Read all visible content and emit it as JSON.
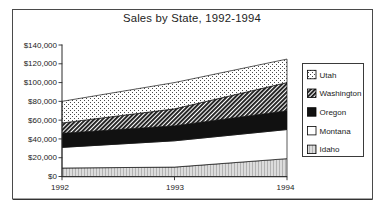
{
  "chart_data": {
    "type": "area",
    "stacked": true,
    "title": "Sales by State, 1992-1994",
    "x": [
      1992,
      1993,
      1994
    ],
    "x_labels": [
      "1992",
      "1993",
      "1994"
    ],
    "series": [
      {
        "name": "Idaho",
        "values": [
          9000,
          10000,
          19000
        ],
        "pattern": "gray-halftone"
      },
      {
        "name": "Montana",
        "values": [
          22000,
          28000,
          31000
        ],
        "pattern": "white"
      },
      {
        "name": "Oregon",
        "values": [
          15000,
          16000,
          20000
        ],
        "pattern": "solid-black"
      },
      {
        "name": "Washington",
        "values": [
          11000,
          18000,
          30000
        ],
        "pattern": "dark-hatch"
      },
      {
        "name": "Utah",
        "values": [
          23000,
          28000,
          25000
        ],
        "pattern": "light-dots"
      }
    ],
    "legend": [
      {
        "label": "Utah",
        "pattern": "light-dots"
      },
      {
        "label": "Washington",
        "pattern": "dark-hatch"
      },
      {
        "label": "Oregon",
        "pattern": "solid-black"
      },
      {
        "label": "Montana",
        "pattern": "white"
      },
      {
        "label": "Idaho",
        "pattern": "gray-halftone"
      }
    ],
    "legend_position": "right",
    "ylim": [
      0,
      140000
    ],
    "y_tick_step": 20000,
    "y_tick_labels": [
      "$0",
      "$20,000",
      "$40,000",
      "$60,000",
      "$80,000",
      "$100,000",
      "$120,000",
      "$140,000"
    ],
    "grid": false,
    "colors": {
      "line": "#2a2a2a",
      "text": "#232323",
      "fill_white": "#ffffff",
      "fill_black": "#111111",
      "fill_gray": "#dcdcdc"
    }
  }
}
